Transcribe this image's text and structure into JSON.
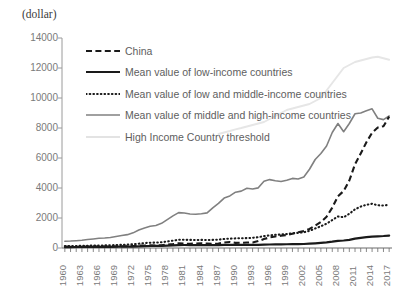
{
  "unit_label": "(dollar)",
  "legend": {
    "items": [
      {
        "label": "China",
        "style": "dashed-black",
        "color": "#1a1a1a"
      },
      {
        "label": "Mean value of low-income countries",
        "style": "solid-thick-black",
        "color": "#1a1a1a"
      },
      {
        "label": "Mean value of low and middle-income countries",
        "style": "dotted-black",
        "color": "#1a1a1a"
      },
      {
        "label": "Mean value of middle and high-income countries",
        "style": "solid-gray",
        "color": "#808080"
      },
      {
        "label": "High Income Country threshold",
        "style": "solid-lightgray",
        "color": "#e3e3e3"
      }
    ]
  },
  "chart_data": {
    "type": "line",
    "title": "",
    "subtitle": "",
    "xlabel": "",
    "ylabel": "(dollar)",
    "ylim": [
      0,
      14000
    ],
    "xlim": [
      1960,
      2018
    ],
    "grid": false,
    "legend_position": "inside-top-left",
    "ytick_labels": [
      "14000",
      "12000",
      "10000",
      "8000",
      "6000",
      "4000",
      "2000",
      "0"
    ],
    "ytick_values": [
      14000,
      12000,
      10000,
      8000,
      6000,
      4000,
      2000,
      0
    ],
    "xtick_labels": [
      "1960",
      "1963",
      "1966",
      "1969",
      "1972",
      "1975",
      "1978",
      "1981",
      "1984",
      "1987",
      "1990",
      "1993",
      "1996",
      "1999",
      "2002",
      "2005",
      "2008",
      "2011",
      "2014",
      "2017"
    ],
    "xtick_values": [
      1960,
      1963,
      1966,
      1969,
      1972,
      1975,
      1978,
      1981,
      1984,
      1987,
      1990,
      1993,
      1996,
      1999,
      2002,
      2005,
      2008,
      2011,
      2014,
      2017
    ],
    "x": [
      1960,
      1961,
      1962,
      1963,
      1964,
      1965,
      1966,
      1967,
      1968,
      1969,
      1970,
      1971,
      1972,
      1973,
      1974,
      1975,
      1976,
      1977,
      1978,
      1979,
      1980,
      1981,
      1982,
      1983,
      1984,
      1985,
      1986,
      1987,
      1988,
      1989,
      1990,
      1991,
      1992,
      1993,
      1994,
      1995,
      1996,
      1997,
      1998,
      1999,
      2000,
      2001,
      2002,
      2003,
      2004,
      2005,
      2006,
      2007,
      2008,
      2009,
      2010,
      2011,
      2012,
      2013,
      2014,
      2015,
      2016,
      2017
    ],
    "series": [
      {
        "name": "China",
        "style": "dashed-black",
        "color": "#1a1a1a",
        "values": [
          89,
          75,
          70,
          73,
          84,
          97,
          103,
          96,
          90,
          99,
          112,
          117,
          130,
          155,
          158,
          176,
          163,
          183,
          228,
          262,
          307,
          287,
          282,
          298,
          313,
          292,
          279,
          294,
          366,
          400,
          344,
          349,
          362,
          371,
          461,
          601,
          703,
          770,
          816,
          865,
          954,
          1045,
          1140,
          1274,
          1487,
          1732,
          2086,
          2692,
          3450,
          3800,
          4500,
          5580,
          6300,
          7050,
          7680,
          8030,
          8120,
          8760
        ]
      },
      {
        "name": "Mean value of low-income countries",
        "style": "solid-thick-black",
        "color": "#1a1a1a",
        "values": [
          63,
          64,
          66,
          70,
          74,
          77,
          78,
          78,
          80,
          85,
          90,
          93,
          98,
          112,
          126,
          134,
          138,
          146,
          160,
          175,
          195,
          200,
          198,
          195,
          190,
          188,
          190,
          198,
          205,
          210,
          215,
          212,
          208,
          205,
          210,
          220,
          232,
          240,
          245,
          250,
          258,
          262,
          268,
          285,
          310,
          340,
          375,
          420,
          480,
          500,
          540,
          620,
          680,
          720,
          760,
          780,
          800,
          830
        ]
      },
      {
        "name": "Mean value of low and middle-income countries",
        "style": "dotted-black",
        "color": "#1a1a1a",
        "values": [
          128,
          130,
          136,
          144,
          155,
          163,
          170,
          173,
          180,
          195,
          212,
          222,
          248,
          288,
          330,
          352,
          360,
          385,
          435,
          490,
          545,
          548,
          540,
          536,
          540,
          535,
          540,
          560,
          600,
          625,
          640,
          650,
          660,
          680,
          720,
          790,
          840,
          880,
          900,
          930,
          980,
          1010,
          1050,
          1140,
          1300,
          1450,
          1620,
          1860,
          2100,
          2050,
          2280,
          2580,
          2760,
          2880,
          2950,
          2850,
          2830,
          2880
        ]
      },
      {
        "name": "Mean value of middle and high-income countries",
        "style": "solid-gray",
        "color": "#808080",
        "values": [
          455,
          462,
          488,
          520,
          565,
          605,
          645,
          665,
          700,
          765,
          835,
          890,
          1010,
          1205,
          1330,
          1445,
          1505,
          1645,
          1890,
          2140,
          2360,
          2330,
          2270,
          2250,
          2280,
          2340,
          2680,
          2980,
          3330,
          3470,
          3720,
          3790,
          3980,
          3930,
          4010,
          4450,
          4560,
          4480,
          4430,
          4520,
          4640,
          4600,
          4740,
          5250,
          5900,
          6300,
          6800,
          7700,
          8300,
          7750,
          8300,
          8950,
          9000,
          9150,
          9280,
          8650,
          8560,
          8800
        ]
      },
      {
        "name": "High Income Country threshold",
        "style": "solid-lightgray",
        "color": "#e6e6e6",
        "values": [
          null,
          null,
          null,
          null,
          null,
          null,
          null,
          null,
          null,
          null,
          null,
          null,
          null,
          null,
          null,
          null,
          null,
          null,
          null,
          null,
          null,
          null,
          null,
          null,
          null,
          null,
          null,
          7600,
          7700,
          7800,
          7910,
          8000,
          8100,
          8200,
          8300,
          8400,
          8600,
          8800,
          9000,
          9200,
          9300,
          9400,
          9500,
          9600,
          9800,
          10000,
          10500,
          11000,
          11500,
          12000,
          12200,
          12400,
          12500,
          12600,
          12700,
          12750,
          12650,
          12550
        ]
      }
    ]
  }
}
